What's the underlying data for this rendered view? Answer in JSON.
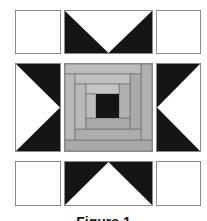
{
  "figure": {
    "caption": "Figure 1",
    "colors": {
      "dark": "#151515",
      "light": "#ffffff",
      "gray1": "#a9a9a9",
      "gray2": "#b9b9b9",
      "line": "#555555"
    },
    "blocks": [
      "corner-square",
      "flying-geese-top",
      "corner-square",
      "flying-geese-left",
      "log-cabin-center",
      "flying-geese-right",
      "corner-square",
      "flying-geese-bottom",
      "corner-square"
    ]
  }
}
